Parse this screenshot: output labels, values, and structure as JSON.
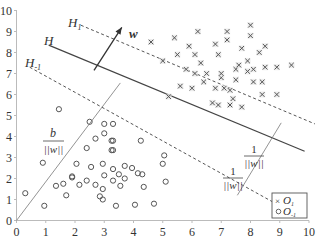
{
  "chart_data": {
    "type": "scatter",
    "title": "",
    "xlabel": "",
    "ylabel": "",
    "xlim": [
      0,
      10
    ],
    "ylim": [
      0,
      10
    ],
    "grid": false,
    "x_ticks": [
      "0",
      "1",
      "2",
      "3",
      "4",
      "5",
      "6",
      "7",
      "8",
      "9",
      "10"
    ],
    "y_ticks": [
      "0",
      "1",
      "2",
      "3",
      "4",
      "5",
      "6",
      "7",
      "8",
      "9",
      "10"
    ],
    "legend": {
      "position": "lower right",
      "entries": [
        {
          "marker": "×",
          "label": "O",
          "sub": "1"
        },
        {
          "marker": "○",
          "label": "O",
          "sub": "-1"
        }
      ]
    },
    "series": [
      {
        "name": "O_1",
        "marker": "x",
        "points": [
          [
            4.6,
            8.5
          ],
          [
            5.0,
            7.6
          ],
          [
            5.5,
            7.9
          ],
          [
            5.9,
            8.3
          ],
          [
            5.4,
            8.7
          ],
          [
            5.8,
            7.2
          ],
          [
            6.1,
            7.9
          ],
          [
            6.3,
            7.5
          ],
          [
            6.8,
            8.4
          ],
          [
            6.9,
            7.9
          ],
          [
            6.1,
            7.0
          ],
          [
            6.5,
            7.0
          ],
          [
            7.0,
            6.8
          ],
          [
            6.4,
            6.6
          ],
          [
            7.1,
            6.3
          ],
          [
            6.8,
            6.3
          ],
          [
            7.3,
            6.2
          ],
          [
            7.5,
            6.7
          ],
          [
            6.7,
            5.6
          ],
          [
            6.9,
            5.5
          ],
          [
            7.2,
            9.0
          ],
          [
            7.2,
            8.6
          ],
          [
            7.5,
            7.2
          ],
          [
            7.0,
            7.0
          ],
          [
            7.6,
            7.4
          ],
          [
            7.9,
            7.1
          ],
          [
            7.4,
            5.8
          ],
          [
            8.1,
            6.6
          ],
          [
            7.7,
            5.4
          ],
          [
            7.3,
            5.5
          ],
          [
            8.4,
            6.6
          ],
          [
            8.5,
            7.3
          ],
          [
            8.1,
            7.2
          ],
          [
            8.3,
            8.0
          ],
          [
            7.7,
            8.2
          ],
          [
            7.9,
            7.6
          ],
          [
            8.9,
            7.3
          ],
          [
            9.4,
            7.4
          ],
          [
            8.4,
            6.0
          ],
          [
            8.9,
            6.0
          ],
          [
            6.2,
            9.0
          ],
          [
            8.0,
            9.3
          ],
          [
            8.0,
            8.8
          ],
          [
            8.5,
            8.3
          ],
          [
            6.0,
            6.3
          ],
          [
            5.6,
            6.4
          ],
          [
            5.2,
            5.9
          ]
        ]
      },
      {
        "name": "O_-1",
        "marker": "o",
        "points": [
          [
            0.3,
            1.3
          ],
          [
            0.9,
            2.75
          ],
          [
            0.95,
            0.7
          ],
          [
            1.35,
            1.65
          ],
          [
            1.6,
            1.75
          ],
          [
            1.7,
            1.2
          ],
          [
            1.9,
            2.1
          ],
          [
            2.05,
            2.7
          ],
          [
            2.15,
            1.7
          ],
          [
            2.4,
            1.9
          ],
          [
            2.4,
            3.45
          ],
          [
            2.55,
            2.55
          ],
          [
            2.7,
            3.9
          ],
          [
            2.7,
            1.7
          ],
          [
            2.85,
            1.15
          ],
          [
            2.95,
            1.0
          ],
          [
            2.95,
            1.5
          ],
          [
            3.0,
            2.15
          ],
          [
            2.95,
            2.7
          ],
          [
            3.0,
            4.15
          ],
          [
            3.0,
            4.6
          ],
          [
            3.3,
            3.8
          ],
          [
            3.3,
            3.35
          ],
          [
            3.3,
            2.45
          ],
          [
            3.3,
            1.9
          ],
          [
            3.4,
            0.7
          ],
          [
            3.5,
            2.2
          ],
          [
            3.55,
            1.65
          ],
          [
            3.7,
            2.0
          ],
          [
            3.7,
            2.6
          ],
          [
            3.95,
            2.5
          ],
          [
            4.05,
            0.75
          ],
          [
            4.15,
            2.25
          ],
          [
            4.3,
            2.2
          ],
          [
            4.35,
            1.6
          ],
          [
            4.25,
            3.8
          ],
          [
            4.7,
            0.8
          ],
          [
            5.05,
            3.1
          ],
          [
            5.1,
            1.85
          ],
          [
            5.0,
            2.7
          ],
          [
            3.3,
            4.6
          ],
          [
            2.5,
            4.7
          ],
          [
            1.9,
            2.05
          ],
          [
            3.25,
            3.8
          ],
          [
            3.25,
            3.35
          ],
          [
            1.45,
            5.3
          ]
        ]
      }
    ],
    "annotations": {
      "H": {
        "label": "H",
        "style": "solid",
        "from": [
          1.1,
          8.35
        ],
        "to": [
          9.85,
          3.3
        ]
      },
      "H1": {
        "label": "H",
        "sub": "1",
        "style": "dashed",
        "from": [
          2.2,
          9.3
        ],
        "to": [
          10.2,
          4.6
        ]
      },
      "Hm1": {
        "label": "H",
        "sub": "-1",
        "style": "dashed",
        "from": [
          0.45,
          7.3
        ],
        "to": [
          9.0,
          0.7
        ]
      },
      "w_arrow": {
        "label": "w",
        "from": [
          2.65,
          7.15
        ],
        "to": [
          3.6,
          9.2
        ]
      },
      "b_label": {
        "num": "b",
        "den": "||w||"
      },
      "margin_label_upper": {
        "num": "1",
        "den": "||w||"
      },
      "margin_label_lower": {
        "num": "1",
        "den": "||w||"
      },
      "origin_line": {
        "from": [
          0,
          0
        ],
        "to": [
          3.55,
          6.55
        ]
      },
      "margin_line": {
        "from": [
          7.55,
          1.2
        ],
        "to": [
          9.05,
          4.65
        ]
      }
    }
  }
}
